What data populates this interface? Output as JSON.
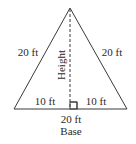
{
  "diagram": {
    "type": "isosceles-triangle",
    "labels": {
      "left_side": "20 ft",
      "right_side": "20 ft",
      "height": "Height",
      "left_half_base": "10 ft",
      "right_half_base": "10 ft",
      "base_length": "20 ft",
      "base": "Base"
    },
    "colors": {
      "stroke": "#3a3a3a",
      "text": "#2a2a2a",
      "background": "#ffffff"
    }
  }
}
